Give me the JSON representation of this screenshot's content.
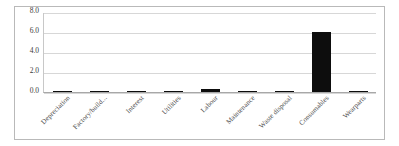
{
  "chart_data": {
    "type": "bar",
    "title": "",
    "xlabel": "",
    "ylabel": "",
    "categories": [
      "Depreciation",
      "Factory/build...",
      "Interest",
      "Utilities",
      "Labour",
      "Maintenance",
      "Waste disposal",
      "Consumables",
      "Wearparts"
    ],
    "values": [
      0.1,
      0.05,
      0.0,
      0.06,
      0.35,
      0.05,
      0.05,
      6.0,
      0.05
    ],
    "ylim": [
      0.0,
      8.0
    ],
    "yticks": [
      "0.0",
      "2.0",
      "4.0",
      "6.0",
      "8.0"
    ],
    "ytick_values": [
      0.0,
      2.0,
      4.0,
      6.0,
      8.0
    ],
    "grid": true,
    "legend": "none",
    "bar_color": "#0d0d0d",
    "grid_color": "#d7d7d7",
    "axis_color": "#a8a8a8",
    "frame_color": "#b9b9b9",
    "label_rotation": -45
  }
}
